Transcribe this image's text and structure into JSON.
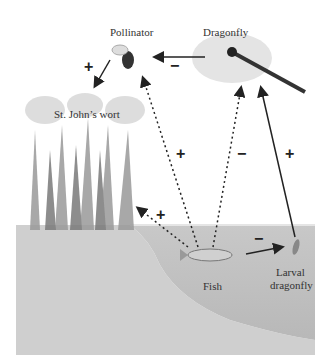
{
  "diagram": {
    "nodes": {
      "pollinator": "Pollinator",
      "dragonfly": "Dragonfly",
      "st_johns_wort": "St. John’s wort",
      "fish": "Fish",
      "larval_dragonfly_line1": "Larval",
      "larval_dragonfly_line2": "dragonfly"
    },
    "edges": [
      {
        "from": "Dragonfly",
        "to": "Pollinator",
        "sign": "−",
        "style": "solid"
      },
      {
        "from": "Pollinator",
        "to": "St. John’s wort",
        "sign": "+",
        "style": "solid"
      },
      {
        "from": "Fish",
        "to": "Pollinator",
        "sign": "+",
        "style": "dotted"
      },
      {
        "from": "Fish",
        "to": "Dragonfly",
        "sign": "−",
        "style": "dotted"
      },
      {
        "from": "Larval dragonfly",
        "to": "Dragonfly",
        "sign": "+",
        "style": "solid"
      },
      {
        "from": "Fish",
        "to": "St. John’s wort",
        "sign": "+",
        "style": "dotted"
      },
      {
        "from": "Fish",
        "to": "Larval dragonfly",
        "sign": "−",
        "style": "solid"
      }
    ],
    "signs": {
      "dragonfly_pollinator": "−",
      "pollinator_wort": "+",
      "fish_pollinator": "+",
      "fish_dragonfly": "−",
      "larval_dragonfly": "+",
      "fish_wort": "+",
      "fish_larval": "−"
    }
  }
}
